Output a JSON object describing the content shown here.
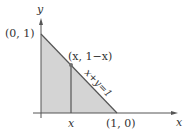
{
  "diagram": {
    "title": "",
    "axes": {
      "x_label": "x",
      "y_label": "y"
    },
    "labels": {
      "top_vertex": "(0, 1)",
      "point": "(x, 1−x)",
      "line": "x+y=1",
      "right_vertex": "(1, 0)",
      "x_tick": "x"
    },
    "colors": {
      "fill": "#d4d4d4",
      "line": "#555555",
      "point": "#707070"
    },
    "region": "triangle bounded by x=0, y=0 and x+y=1"
  }
}
